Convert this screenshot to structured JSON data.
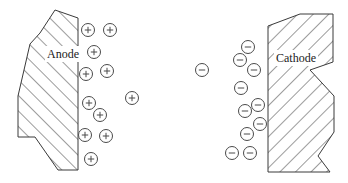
{
  "figure": {
    "type": "electrochemical-cell-diagram",
    "width": 348,
    "height": 183,
    "background_color": "#ffffff"
  },
  "electrodes": [
    {
      "id": "anode",
      "label": "Anode",
      "side": "left",
      "label_x": 47,
      "label_y": 58,
      "hatch_direction": "up-right",
      "hatch_angle_deg": 45,
      "hatch_spacing": 11,
      "outline_color": "#3a3a3a",
      "points": "55,10 78,18 78,170 58,170 35,137 18,137 18,96 30,44 40,33"
    },
    {
      "id": "cathode",
      "label": "Cathode",
      "side": "right",
      "label_x": 276,
      "label_y": 62,
      "hatch_direction": "down-right",
      "hatch_angle_deg": -45,
      "hatch_spacing": 11,
      "outline_color": "#3a3a3a",
      "points": "268,26 300,14 333,14 333,62 310,70 334,96 334,132 318,156 330,172 268,172"
    }
  ],
  "ions": {
    "positive": {
      "sign": "+",
      "charge_label": "positive-ion",
      "radius": 6.5,
      "stroke_color": "#4a4a4a",
      "count": 11,
      "positions": [
        {
          "x": 88,
          "y": 30
        },
        {
          "x": 110,
          "y": 30
        },
        {
          "x": 94,
          "y": 52
        },
        {
          "x": 86,
          "y": 74
        },
        {
          "x": 107,
          "y": 71
        },
        {
          "x": 89,
          "y": 103
        },
        {
          "x": 100,
          "y": 115
        },
        {
          "x": 132,
          "y": 98
        },
        {
          "x": 85,
          "y": 135
        },
        {
          "x": 106,
          "y": 136
        },
        {
          "x": 91,
          "y": 159
        }
      ]
    },
    "negative": {
      "sign": "−",
      "charge_label": "negative-ion",
      "radius": 6.5,
      "stroke_color": "#4a4a4a",
      "count": 11,
      "positions": [
        {
          "x": 248,
          "y": 47
        },
        {
          "x": 240,
          "y": 60
        },
        {
          "x": 254,
          "y": 70
        },
        {
          "x": 202,
          "y": 70
        },
        {
          "x": 241,
          "y": 88
        },
        {
          "x": 258,
          "y": 105
        },
        {
          "x": 245,
          "y": 111
        },
        {
          "x": 260,
          "y": 124
        },
        {
          "x": 247,
          "y": 134
        },
        {
          "x": 232,
          "y": 153
        },
        {
          "x": 250,
          "y": 153
        }
      ]
    }
  }
}
